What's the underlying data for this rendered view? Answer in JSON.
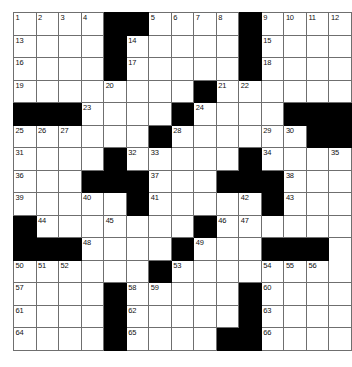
{
  "puzzle": {
    "type": "crossword-grid",
    "title": "Crossword Puzzle Grid",
    "columns": 14,
    "rows": 15,
    "colors": {
      "block": "#000000",
      "cell": "#ffffff",
      "gridline": "#6f6f6f",
      "number": "#111111",
      "background": "#ffffff"
    },
    "legend": {
      "white_cell": "open-letter-square",
      "black_cell": "blocked-square"
    },
    "max_clue_number": 66,
    "cells": [
      [
        {
          "b": false,
          "n": "1"
        },
        {
          "b": false,
          "n": "2"
        },
        {
          "b": false,
          "n": "3"
        },
        {
          "b": false,
          "n": "4"
        },
        {
          "b": true,
          "n": ""
        },
        {
          "b": true,
          "n": ""
        },
        {
          "b": false,
          "n": "5"
        },
        {
          "b": false,
          "n": "6"
        },
        {
          "b": false,
          "n": "7"
        },
        {
          "b": false,
          "n": "8"
        },
        {
          "b": true,
          "n": ""
        },
        {
          "b": false,
          "n": "9"
        },
        {
          "b": false,
          "n": "10"
        },
        {
          "b": false,
          "n": "11"
        },
        {
          "b": false,
          "n": "12"
        }
      ],
      [
        {
          "b": false,
          "n": "13"
        },
        {
          "b": false,
          "n": ""
        },
        {
          "b": false,
          "n": ""
        },
        {
          "b": false,
          "n": ""
        },
        {
          "b": true,
          "n": ""
        },
        {
          "b": false,
          "n": "14"
        },
        {
          "b": false,
          "n": ""
        },
        {
          "b": false,
          "n": ""
        },
        {
          "b": false,
          "n": ""
        },
        {
          "b": false,
          "n": ""
        },
        {
          "b": true,
          "n": ""
        },
        {
          "b": false,
          "n": "15"
        },
        {
          "b": false,
          "n": ""
        },
        {
          "b": false,
          "n": ""
        },
        {
          "b": false,
          "n": ""
        }
      ],
      [
        {
          "b": false,
          "n": "16"
        },
        {
          "b": false,
          "n": ""
        },
        {
          "b": false,
          "n": ""
        },
        {
          "b": false,
          "n": ""
        },
        {
          "b": true,
          "n": ""
        },
        {
          "b": false,
          "n": "17"
        },
        {
          "b": false,
          "n": ""
        },
        {
          "b": false,
          "n": ""
        },
        {
          "b": false,
          "n": ""
        },
        {
          "b": false,
          "n": ""
        },
        {
          "b": true,
          "n": ""
        },
        {
          "b": false,
          "n": "18"
        },
        {
          "b": false,
          "n": ""
        },
        {
          "b": false,
          "n": ""
        },
        {
          "b": false,
          "n": ""
        }
      ],
      [
        {
          "b": false,
          "n": "19"
        },
        {
          "b": false,
          "n": ""
        },
        {
          "b": false,
          "n": ""
        },
        {
          "b": false,
          "n": ""
        },
        {
          "b": false,
          "n": "20"
        },
        {
          "b": false,
          "n": ""
        },
        {
          "b": false,
          "n": ""
        },
        {
          "b": false,
          "n": ""
        },
        {
          "b": true,
          "n": ""
        },
        {
          "b": false,
          "n": "21"
        },
        {
          "b": false,
          "n": "22"
        },
        {
          "b": false,
          "n": ""
        },
        {
          "b": false,
          "n": ""
        },
        {
          "b": false,
          "n": ""
        },
        {
          "b": false,
          "n": ""
        }
      ],
      [
        {
          "b": true,
          "n": ""
        },
        {
          "b": true,
          "n": ""
        },
        {
          "b": true,
          "n": ""
        },
        {
          "b": false,
          "n": "23"
        },
        {
          "b": false,
          "n": ""
        },
        {
          "b": false,
          "n": ""
        },
        {
          "b": false,
          "n": ""
        },
        {
          "b": true,
          "n": ""
        },
        {
          "b": false,
          "n": "24"
        },
        {
          "b": false,
          "n": ""
        },
        {
          "b": false,
          "n": ""
        },
        {
          "b": false,
          "n": ""
        },
        {
          "b": true,
          "n": ""
        },
        {
          "b": true,
          "n": ""
        },
        {
          "b": true,
          "n": ""
        }
      ],
      [
        {
          "b": false,
          "n": "25"
        },
        {
          "b": false,
          "n": "26"
        },
        {
          "b": false,
          "n": "27"
        },
        {
          "b": false,
          "n": ""
        },
        {
          "b": false,
          "n": ""
        },
        {
          "b": false,
          "n": ""
        },
        {
          "b": true,
          "n": ""
        },
        {
          "b": false,
          "n": "28"
        },
        {
          "b": false,
          "n": ""
        },
        {
          "b": false,
          "n": ""
        },
        {
          "b": false,
          "n": ""
        },
        {
          "b": false,
          "n": "29"
        },
        {
          "b": false,
          "n": "30"
        },
        {
          "b": true,
          "n": ""
        },
        {
          "b": true,
          "n": ""
        }
      ],
      [
        {
          "b": false,
          "n": "31"
        },
        {
          "b": false,
          "n": ""
        },
        {
          "b": false,
          "n": ""
        },
        {
          "b": false,
          "n": ""
        },
        {
          "b": true,
          "n": ""
        },
        {
          "b": false,
          "n": "32"
        },
        {
          "b": false,
          "n": "33"
        },
        {
          "b": false,
          "n": ""
        },
        {
          "b": false,
          "n": ""
        },
        {
          "b": false,
          "n": ""
        },
        {
          "b": true,
          "n": ""
        },
        {
          "b": false,
          "n": "34"
        },
        {
          "b": false,
          "n": ""
        },
        {
          "b": false,
          "n": ""
        },
        {
          "b": false,
          "n": "35"
        }
      ],
      [
        {
          "b": false,
          "n": "36"
        },
        {
          "b": false,
          "n": ""
        },
        {
          "b": false,
          "n": ""
        },
        {
          "b": true,
          "n": ""
        },
        {
          "b": true,
          "n": ""
        },
        {
          "b": true,
          "n": ""
        },
        {
          "b": false,
          "n": "37"
        },
        {
          "b": false,
          "n": ""
        },
        {
          "b": false,
          "n": ""
        },
        {
          "b": true,
          "n": ""
        },
        {
          "b": true,
          "n": ""
        },
        {
          "b": true,
          "n": ""
        },
        {
          "b": false,
          "n": "38"
        },
        {
          "b": false,
          "n": ""
        },
        {
          "b": false,
          "n": ""
        }
      ],
      [
        {
          "b": false,
          "n": "39"
        },
        {
          "b": false,
          "n": ""
        },
        {
          "b": false,
          "n": ""
        },
        {
          "b": false,
          "n": "40"
        },
        {
          "b": false,
          "n": ""
        },
        {
          "b": true,
          "n": ""
        },
        {
          "b": false,
          "n": "41"
        },
        {
          "b": false,
          "n": ""
        },
        {
          "b": false,
          "n": ""
        },
        {
          "b": false,
          "n": ""
        },
        {
          "b": false,
          "n": "42"
        },
        {
          "b": true,
          "n": ""
        },
        {
          "b": false,
          "n": "43"
        },
        {
          "b": false,
          "n": ""
        },
        {
          "b": false,
          "n": ""
        }
      ],
      [
        {
          "b": true,
          "n": ""
        },
        {
          "b": false,
          "n": "44"
        },
        {
          "b": false,
          "n": ""
        },
        {
          "b": false,
          "n": ""
        },
        {
          "b": false,
          "n": "45"
        },
        {
          "b": false,
          "n": ""
        },
        {
          "b": false,
          "n": ""
        },
        {
          "b": false,
          "n": ""
        },
        {
          "b": true,
          "n": ""
        },
        {
          "b": false,
          "n": "46"
        },
        {
          "b": false,
          "n": "47"
        },
        {
          "b": false,
          "n": ""
        },
        {
          "b": false,
          "n": ""
        },
        {
          "b": false,
          "n": ""
        },
        {
          "b": false,
          "n": ""
        }
      ],
      [
        {
          "b": true,
          "n": ""
        },
        {
          "b": true,
          "n": ""
        },
        {
          "b": true,
          "n": ""
        },
        {
          "b": false,
          "n": "48"
        },
        {
          "b": false,
          "n": ""
        },
        {
          "b": false,
          "n": ""
        },
        {
          "b": false,
          "n": ""
        },
        {
          "b": true,
          "n": ""
        },
        {
          "b": false,
          "n": "49"
        },
        {
          "b": false,
          "n": ""
        },
        {
          "b": false,
          "n": ""
        },
        {
          "b": true,
          "n": ""
        },
        {
          "b": true,
          "n": ""
        },
        {
          "b": true,
          "n": ""
        }
      ],
      [
        {
          "b": false,
          "n": "50"
        },
        {
          "b": false,
          "n": "51"
        },
        {
          "b": false,
          "n": "52"
        },
        {
          "b": false,
          "n": ""
        },
        {
          "b": false,
          "n": ""
        },
        {
          "b": false,
          "n": ""
        },
        {
          "b": true,
          "n": ""
        },
        {
          "b": false,
          "n": "53"
        },
        {
          "b": false,
          "n": ""
        },
        {
          "b": false,
          "n": ""
        },
        {
          "b": false,
          "n": ""
        },
        {
          "b": false,
          "n": "54"
        },
        {
          "b": false,
          "n": "55"
        },
        {
          "b": false,
          "n": "56"
        }
      ],
      [
        {
          "b": false,
          "n": "57"
        },
        {
          "b": false,
          "n": ""
        },
        {
          "b": false,
          "n": ""
        },
        {
          "b": false,
          "n": ""
        },
        {
          "b": true,
          "n": ""
        },
        {
          "b": false,
          "n": "58"
        },
        {
          "b": false,
          "n": "59"
        },
        {
          "b": false,
          "n": ""
        },
        {
          "b": false,
          "n": ""
        },
        {
          "b": false,
          "n": ""
        },
        {
          "b": true,
          "n": ""
        },
        {
          "b": false,
          "n": "60"
        },
        {
          "b": false,
          "n": ""
        },
        {
          "b": false,
          "n": ""
        },
        {
          "b": false,
          "n": ""
        }
      ],
      [
        {
          "b": false,
          "n": "61"
        },
        {
          "b": false,
          "n": ""
        },
        {
          "b": false,
          "n": ""
        },
        {
          "b": false,
          "n": ""
        },
        {
          "b": true,
          "n": ""
        },
        {
          "b": false,
          "n": "62"
        },
        {
          "b": false,
          "n": ""
        },
        {
          "b": false,
          "n": ""
        },
        {
          "b": false,
          "n": ""
        },
        {
          "b": false,
          "n": ""
        },
        {
          "b": true,
          "n": ""
        },
        {
          "b": false,
          "n": "63"
        },
        {
          "b": false,
          "n": ""
        },
        {
          "b": false,
          "n": ""
        },
        {
          "b": false,
          "n": ""
        }
      ],
      [
        {
          "b": false,
          "n": "64"
        },
        {
          "b": false,
          "n": ""
        },
        {
          "b": false,
          "n": ""
        },
        {
          "b": false,
          "n": ""
        },
        {
          "b": true,
          "n": ""
        },
        {
          "b": false,
          "n": "65"
        },
        {
          "b": false,
          "n": ""
        },
        {
          "b": false,
          "n": ""
        },
        {
          "b": false,
          "n": ""
        },
        {
          "b": true,
          "n": ""
        },
        {
          "b": true,
          "n": ""
        },
        {
          "b": false,
          "n": "66"
        },
        {
          "b": false,
          "n": ""
        },
        {
          "b": false,
          "n": ""
        },
        {
          "b": false,
          "n": ""
        }
      ]
    ]
  }
}
